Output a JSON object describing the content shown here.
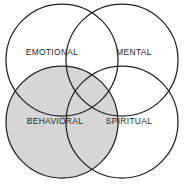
{
  "diagram": {
    "type": "venn",
    "canvas": {
      "width": 184,
      "height": 188,
      "background": "#ffffff"
    },
    "style": {
      "stroke_color": "#231f20",
      "stroke_width": 1.25,
      "shaded_fill": "#d6d6d6",
      "unshaded_fill": "#ffffff",
      "label_color": "#231f20"
    },
    "circles": [
      {
        "id": "emotional",
        "label": "EMOTIONAL",
        "cx": 62,
        "cy": 60,
        "r": 56,
        "shaded": false,
        "label_x": 52,
        "label_y": 53
      },
      {
        "id": "mental",
        "label": "MENTAL",
        "cx": 122,
        "cy": 60,
        "r": 56,
        "shaded": false,
        "label_x": 134,
        "label_y": 53
      },
      {
        "id": "behavioral",
        "label": "BEHAVIORAL",
        "cx": 62,
        "cy": 122,
        "r": 56,
        "shaded": true,
        "label_x": 55,
        "label_y": 122
      },
      {
        "id": "spiritual",
        "label": "SPIRITUAL",
        "cx": 122,
        "cy": 122,
        "r": 56,
        "shaded": false,
        "label_x": 129,
        "label_y": 122
      }
    ]
  }
}
